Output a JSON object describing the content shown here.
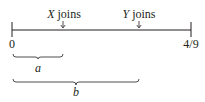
{
  "diagram": {
    "type": "timeline",
    "colors": {
      "ink": "#231f20",
      "background": "#ffffff"
    },
    "axis": {
      "start_label": "0",
      "end_label": "4/9"
    },
    "events": [
      {
        "var": "X",
        "text": " joins"
      },
      {
        "var": "Y",
        "text": " joins"
      }
    ],
    "braces": [
      {
        "label": "a"
      },
      {
        "label": "b"
      }
    ]
  }
}
